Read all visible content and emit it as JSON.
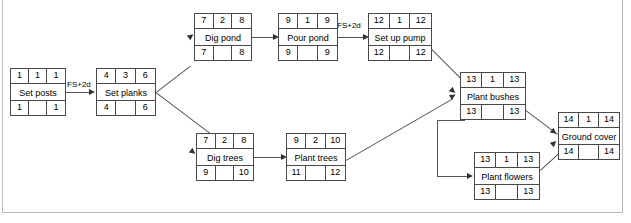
{
  "diagram": {
    "type": "precedence-network",
    "node_legend": {
      "top_left": "early start",
      "top_middle": "duration",
      "top_right": "early finish",
      "middle": "activity name",
      "bottom_left": "late start",
      "bottom_right": "late finish"
    },
    "nodes": [
      {
        "id": "set-posts",
        "name": "Set posts",
        "early_start": "1",
        "duration": "1",
        "early_finish": "1",
        "late_start": "1",
        "late_slack": "",
        "late_finish": "1",
        "x": 10,
        "y": 68,
        "w": 56,
        "h": 48
      },
      {
        "id": "set-planks",
        "name": "Set planks",
        "early_start": "4",
        "duration": "3",
        "early_finish": "6",
        "late_start": "4",
        "late_slack": "",
        "late_finish": "6",
        "x": 96,
        "y": 68,
        "w": 60,
        "h": 48
      },
      {
        "id": "dig-pond",
        "name": "Dig pond",
        "early_start": "7",
        "duration": "2",
        "early_finish": "8",
        "late_start": "7",
        "late_slack": "",
        "late_finish": "8",
        "x": 194,
        "y": 13,
        "w": 58,
        "h": 48
      },
      {
        "id": "pour-pond",
        "name": "Pour pond",
        "early_start": "9",
        "duration": "1",
        "early_finish": "9",
        "late_start": "9",
        "late_slack": "",
        "late_finish": "9",
        "x": 278,
        "y": 13,
        "w": 60,
        "h": 48
      },
      {
        "id": "set-up-pump",
        "name": "Set up pump",
        "early_start": "12",
        "duration": "1",
        "early_finish": "12",
        "late_start": "12",
        "late_slack": "",
        "late_finish": "12",
        "x": 368,
        "y": 13,
        "w": 64,
        "h": 48
      },
      {
        "id": "dig-trees",
        "name": "Dig trees",
        "early_start": "7",
        "duration": "2",
        "early_finish": "8",
        "late_start": "9",
        "late_slack": "",
        "late_finish": "10",
        "x": 196,
        "y": 133,
        "w": 58,
        "h": 48
      },
      {
        "id": "plant-trees",
        "name": "Plant trees",
        "early_start": "9",
        "duration": "2",
        "early_finish": "10",
        "late_start": "11",
        "late_slack": "",
        "late_finish": "12",
        "x": 286,
        "y": 133,
        "w": 60,
        "h": 48
      },
      {
        "id": "plant-bushes",
        "name": "Plant bushes",
        "early_start": "13",
        "duration": "1",
        "early_finish": "13",
        "late_start": "13",
        "late_slack": "",
        "late_finish": "13",
        "x": 460,
        "y": 72,
        "w": 66,
        "h": 48
      },
      {
        "id": "plant-flowers",
        "name": "Plant flowers",
        "early_start": "13",
        "duration": "1",
        "early_finish": "13",
        "late_start": "13",
        "late_slack": "",
        "late_finish": "13",
        "x": 474,
        "y": 152,
        "w": 66,
        "h": 48
      },
      {
        "id": "ground-cover",
        "name": "Ground cover",
        "early_start": "14",
        "duration": "1",
        "early_finish": "14",
        "late_start": "14",
        "late_slack": "",
        "late_finish": "14",
        "x": 558,
        "y": 112,
        "w": 62,
        "h": 48
      }
    ],
    "edge_labels": [
      {
        "id": "lag-set-planks",
        "text": "FS+2d",
        "x": 66,
        "y": 83
      },
      {
        "id": "lag-set-up-pump",
        "text": "FS+2d",
        "x": 338,
        "y": 19
      }
    ]
  }
}
